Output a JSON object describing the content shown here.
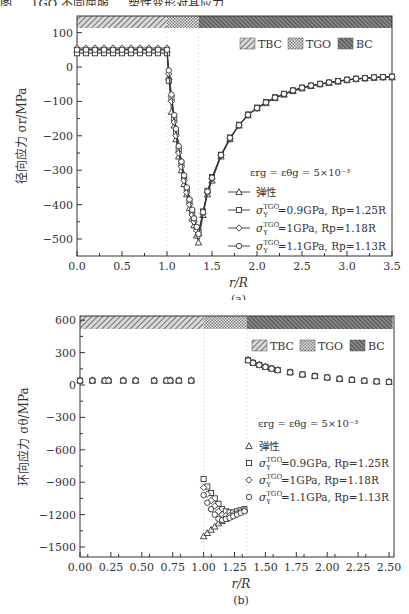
{
  "header_partial_text": "图 ... TGO 不同屈服 ... 塑性变形对其应力",
  "chart_data": [
    {
      "type": "line",
      "id": "a",
      "caption": "(a)",
      "xlabel": "r/R",
      "ylabel": "径向应力 σr/MPa",
      "xlim": [
        0.0,
        3.5
      ],
      "ylim": [
        -550,
        140
      ],
      "xticks": [
        "0.0",
        "0.5",
        "1.0",
        "1.5",
        "2.0",
        "2.5",
        "3.0",
        "3.5"
      ],
      "yticks": [
        "100",
        "0",
        "−100",
        "−200",
        "−300",
        "−400",
        "−500"
      ],
      "regions": [
        {
          "name": "TBC",
          "from": 0.0,
          "to": 1.0
        },
        {
          "name": "TGO",
          "from": 1.0,
          "to": 1.35
        },
        {
          "name": "BC",
          "from": 1.35,
          "to": 3.5
        }
      ],
      "legend_regions": [
        "TBC",
        "TGO",
        "BC"
      ],
      "annotation": "εrg = εθg = 5×10⁻³",
      "series": [
        {
          "name": "弹性",
          "marker": "triangle",
          "x": [
            0.0,
            0.1,
            0.2,
            0.3,
            0.4,
            0.5,
            0.6,
            0.7,
            0.8,
            0.9,
            1.0,
            1.02,
            1.05,
            1.08,
            1.1,
            1.13,
            1.16,
            1.19,
            1.22,
            1.25,
            1.28,
            1.3,
            1.33,
            1.35,
            1.4,
            1.45,
            1.5,
            1.6,
            1.7,
            1.8,
            1.9,
            2.0,
            2.1,
            2.2,
            2.3,
            2.4,
            2.5,
            2.6,
            2.7,
            2.8,
            2.9,
            3.0,
            3.1,
            3.2,
            3.3,
            3.4,
            3.5
          ],
          "y": [
            50,
            50,
            50,
            50,
            50,
            50,
            50,
            50,
            50,
            50,
            50,
            -30,
            -130,
            -170,
            -210,
            -260,
            -300,
            -340,
            -370,
            -410,
            -440,
            -460,
            -490,
            -510,
            -430,
            -370,
            -330,
            -260,
            -210,
            -170,
            -140,
            -120,
            -105,
            -90,
            -80,
            -70,
            -62,
            -55,
            -50,
            -46,
            -42,
            -38,
            -35,
            -33,
            -31,
            -30,
            -30
          ]
        },
        {
          "name": "σY^TGO = 0.9GPa, Rp = 1.25R",
          "marker": "square",
          "x": [
            0.0,
            0.1,
            0.2,
            0.3,
            0.4,
            0.5,
            0.6,
            0.7,
            0.8,
            0.9,
            1.0,
            1.02,
            1.05,
            1.08,
            1.1,
            1.13,
            1.16,
            1.19,
            1.22,
            1.25,
            1.28,
            1.3,
            1.33,
            1.35,
            1.4,
            1.45,
            1.5,
            1.6,
            1.7,
            1.8,
            1.9,
            2.0,
            2.1,
            2.2,
            2.3,
            2.4,
            2.5,
            2.6,
            2.7,
            2.8,
            2.9,
            3.0,
            3.1,
            3.2,
            3.3,
            3.4,
            3.5
          ],
          "y": [
            40,
            40,
            40,
            40,
            40,
            40,
            40,
            40,
            40,
            40,
            40,
            -40,
            -90,
            -150,
            -190,
            -240,
            -280,
            -320,
            -355,
            -390,
            -420,
            -445,
            -470,
            -480,
            -420,
            -360,
            -320,
            -255,
            -205,
            -168,
            -138,
            -118,
            -102,
            -88,
            -78,
            -68,
            -60,
            -54,
            -49,
            -45,
            -41,
            -37,
            -34,
            -32,
            -30,
            -29,
            -28
          ]
        },
        {
          "name": "σY^TGO = 1GPa, Rp = 1.18R",
          "marker": "diamond",
          "x": [
            0.0,
            0.1,
            0.2,
            0.3,
            0.4,
            0.5,
            0.6,
            0.7,
            0.8,
            0.9,
            1.0,
            1.02,
            1.05,
            1.08,
            1.1,
            1.13,
            1.16,
            1.19,
            1.22,
            1.25,
            1.28,
            1.3,
            1.33,
            1.35,
            1.4,
            1.45,
            1.5,
            1.6,
            1.7,
            1.8,
            1.9,
            2.0,
            2.1,
            2.2,
            2.3,
            2.4,
            2.5,
            2.6,
            2.7,
            2.8,
            2.9,
            3.0,
            3.1,
            3.2,
            3.3,
            3.4,
            3.5
          ],
          "y": [
            55,
            55,
            55,
            55,
            55,
            55,
            55,
            55,
            55,
            55,
            55,
            -20,
            -100,
            -160,
            -200,
            -250,
            -290,
            -330,
            -365,
            -400,
            -430,
            -450,
            -475,
            -490,
            -425,
            -365,
            -325,
            -258,
            -208,
            -170,
            -140,
            -120,
            -104,
            -90,
            -79,
            -69,
            -61,
            -55,
            -50,
            -46,
            -42,
            -38,
            -35,
            -33,
            -31,
            -30,
            -29
          ]
        },
        {
          "name": "σY^TGO = 1.1GPa, Rp = 1.13R",
          "marker": "circle",
          "x": [
            0.0,
            0.1,
            0.2,
            0.3,
            0.4,
            0.5,
            0.6,
            0.7,
            0.8,
            0.9,
            1.0,
            1.02,
            1.05,
            1.08,
            1.1,
            1.13,
            1.16,
            1.19,
            1.22,
            1.25,
            1.28,
            1.3,
            1.33,
            1.35,
            1.4,
            1.45,
            1.5,
            1.6,
            1.7,
            1.8,
            1.9,
            2.0,
            2.1,
            2.2,
            2.3,
            2.4,
            2.5,
            2.6,
            2.7,
            2.8,
            2.9,
            3.0,
            3.1,
            3.2,
            3.3,
            3.4,
            3.5
          ],
          "y": [
            50,
            50,
            50,
            50,
            50,
            50,
            50,
            50,
            50,
            50,
            50,
            -10,
            -80,
            -140,
            -180,
            -230,
            -275,
            -315,
            -350,
            -385,
            -415,
            -440,
            -465,
            -485,
            -422,
            -362,
            -322,
            -256,
            -206,
            -169,
            -139,
            -119,
            -103,
            -89,
            -78,
            -68,
            -60,
            -54,
            -49,
            -45,
            -41,
            -37,
            -34,
            -32,
            -30,
            -29,
            -28
          ]
        }
      ]
    },
    {
      "type": "scatter",
      "id": "b",
      "caption": "(b)",
      "xlabel": "r/R",
      "ylabel": "环向应力 σθ/MPa",
      "xlim": [
        0.0,
        2.53
      ],
      "ylim": [
        -1600,
        600
      ],
      "xticks": [
        "0.00",
        "0.25",
        "0.50",
        "0.75",
        "1.00",
        "1.25",
        "1.50",
        "1.75",
        "2.00",
        "2.25",
        "2.50"
      ],
      "yticks": [
        "600",
        "300",
        "0",
        "−300",
        "−600",
        "−900",
        "−1200",
        "−1500"
      ],
      "regions": [
        {
          "name": "TBC",
          "from": 0.0,
          "to": 1.0
        },
        {
          "name": "TGO",
          "from": 1.0,
          "to": 1.35
        },
        {
          "name": "BC",
          "from": 1.35,
          "to": 2.53
        }
      ],
      "legend_regions": [
        "TBC",
        "TGO",
        "BC"
      ],
      "annotation": "εrg = εθg = 5×10⁻³",
      "series": [
        {
          "name": "弹性",
          "marker": "triangle",
          "x": [
            0.0,
            0.1,
            0.2,
            0.23,
            0.35,
            0.45,
            0.6,
            0.7,
            0.73,
            0.8,
            0.9,
            1.0,
            1.03,
            1.06,
            1.09,
            1.12,
            1.15,
            1.18,
            1.21,
            1.24,
            1.27,
            1.3,
            1.33,
            1.36,
            1.4,
            1.45,
            1.5,
            1.55,
            1.6,
            1.7,
            1.8,
            1.9,
            2.0,
            2.1,
            2.2,
            2.3,
            2.4,
            2.5
          ],
          "y": [
            45,
            45,
            45,
            45,
            45,
            45,
            45,
            45,
            45,
            45,
            45,
            -1400,
            -1370,
            -1340,
            -1310,
            -1280,
            -1260,
            -1240,
            -1220,
            -1200,
            -1185,
            -1170,
            -1155,
            235,
            210,
            190,
            170,
            155,
            140,
            120,
            100,
            85,
            72,
            60,
            50,
            42,
            35,
            30
          ]
        },
        {
          "name": "σY^TGO = 0.9GPa, Rp = 1.25R",
          "marker": "square",
          "x": [
            0.0,
            0.1,
            0.2,
            0.23,
            0.35,
            0.45,
            0.6,
            0.7,
            0.73,
            0.8,
            0.9,
            1.0,
            1.03,
            1.06,
            1.09,
            1.12,
            1.15,
            1.18,
            1.21,
            1.24,
            1.27,
            1.3,
            1.33,
            1.36,
            1.4,
            1.45,
            1.5,
            1.55,
            1.6,
            1.7,
            1.8,
            1.9,
            2.0,
            2.1,
            2.2,
            2.3,
            2.4,
            2.5
          ],
          "y": [
            40,
            40,
            40,
            40,
            40,
            40,
            40,
            40,
            40,
            40,
            40,
            -870,
            -940,
            -1000,
            -1050,
            -1100,
            -1150,
            -1170,
            -1180,
            -1180,
            -1170,
            -1160,
            -1150,
            230,
            205,
            185,
            168,
            152,
            138,
            118,
            98,
            83,
            70,
            58,
            48,
            40,
            34,
            28
          ]
        },
        {
          "name": "σY^TGO = 1GPa, Rp = 1.18R",
          "marker": "diamond",
          "x": [
            0.0,
            0.1,
            0.2,
            0.23,
            0.35,
            0.45,
            0.6,
            0.7,
            0.73,
            0.8,
            0.9,
            1.0,
            1.03,
            1.06,
            1.09,
            1.12,
            1.15,
            1.18,
            1.21,
            1.24,
            1.27,
            1.3,
            1.33,
            1.36,
            1.4,
            1.45,
            1.5,
            1.55,
            1.6,
            1.7,
            1.8,
            1.9,
            2.0,
            2.1,
            2.2,
            2.3,
            2.4,
            2.5
          ],
          "y": [
            45,
            45,
            45,
            45,
            45,
            45,
            45,
            45,
            45,
            45,
            45,
            -950,
            -1010,
            -1070,
            -1120,
            -1170,
            -1200,
            -1210,
            -1210,
            -1200,
            -1190,
            -1175,
            -1160,
            232,
            208,
            188,
            170,
            154,
            139,
            119,
            99,
            84,
            71,
            59,
            49,
            41,
            35,
            29
          ]
        },
        {
          "name": "σY^TGO = 1.1GPa, Rp = 1.13R",
          "marker": "circle",
          "x": [
            0.0,
            0.1,
            0.2,
            0.23,
            0.35,
            0.45,
            0.6,
            0.7,
            0.73,
            0.8,
            0.9,
            1.0,
            1.03,
            1.06,
            1.09,
            1.12,
            1.15,
            1.18,
            1.21,
            1.24,
            1.27,
            1.3,
            1.33,
            1.36,
            1.4,
            1.45,
            1.5,
            1.55,
            1.6,
            1.7,
            1.8,
            1.9,
            2.0,
            2.1,
            2.2,
            2.3,
            2.4,
            2.5
          ],
          "y": [
            40,
            40,
            40,
            40,
            40,
            40,
            40,
            40,
            40,
            40,
            40,
            -1020,
            -1090,
            -1150,
            -1200,
            -1240,
            -1250,
            -1240,
            -1230,
            -1215,
            -1200,
            -1185,
            -1170,
            228,
            204,
            184,
            167,
            151,
            137,
            117,
            97,
            82,
            69,
            57,
            47,
            39,
            33,
            27
          ]
        }
      ]
    }
  ],
  "legend_labels": {
    "elastic": "弹性",
    "s09_prefix": "σ",
    "s09_text": "=0.9GPa, Rp=1.25R",
    "s10_text": "=1GPa, Rp=1.18R",
    "s11_text": "=1.1GPa, Rp=1.13R",
    "sup": "TGO",
    "sub": "Y"
  }
}
